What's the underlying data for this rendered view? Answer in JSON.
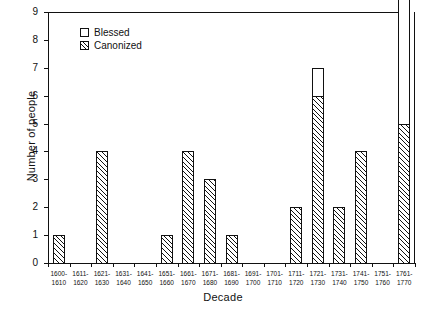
{
  "chart_data": {
    "type": "bar",
    "title": "",
    "xlabel": "Decade",
    "ylabel": "Number of people",
    "ylim": [
      0,
      9
    ],
    "yticks": [
      0,
      1,
      2,
      3,
      4,
      5,
      6,
      7,
      8,
      9
    ],
    "grid": false,
    "legend_position": "top-left",
    "stacked": true,
    "note": "Last bar (1761-1770) extends beyond the top of the axis (truncated at 9).",
    "categories": [
      "1600-\n1610",
      "1611-\n1620",
      "1621-\n1630",
      "1631-\n1640",
      "1641-\n1650",
      "1651-\n1660",
      "1661-\n1670",
      "1671-\n1680",
      "1681-\n1690",
      "1691-\n1700",
      "1701-\n1710",
      "1711-\n1720",
      "1721-\n1730",
      "1731-\n1740",
      "1741-\n1750",
      "1751-\n1760",
      "1761-\n1770"
    ],
    "category_lines": [
      [
        "1600-",
        "1610"
      ],
      [
        "1611-",
        "1620"
      ],
      [
        "1621-",
        "1630"
      ],
      [
        "1631-",
        "1640"
      ],
      [
        "1641-",
        "1650"
      ],
      [
        "1651-",
        "1660"
      ],
      [
        "1661-",
        "1670"
      ],
      [
        "1671-",
        "1680"
      ],
      [
        "1681-",
        "1690"
      ],
      [
        "1691-",
        "1700"
      ],
      [
        "1701-",
        "1710"
      ],
      [
        "1711-",
        "1720"
      ],
      [
        "1721-",
        "1730"
      ],
      [
        "1731-",
        "1740"
      ],
      [
        "1741-",
        "1750"
      ],
      [
        "1751-",
        "1760"
      ],
      [
        "1761-",
        "1770"
      ]
    ],
    "series": [
      {
        "name": "Canonized",
        "style": "hatched",
        "values": [
          1,
          0,
          4,
          0,
          0,
          1,
          4,
          3,
          1,
          0,
          0,
          2,
          6,
          2,
          4,
          0,
          5
        ]
      },
      {
        "name": "Blessed",
        "style": "open",
        "values": [
          0,
          0,
          0,
          0,
          0,
          0,
          0,
          0,
          0,
          0,
          0,
          0,
          1,
          0,
          0,
          0,
          4
        ]
      }
    ],
    "totals": [
      1,
      0,
      4,
      0,
      0,
      1,
      4,
      3,
      1,
      0,
      0,
      2,
      7,
      2,
      4,
      0,
      9
    ]
  },
  "legend": {
    "items": [
      {
        "label": "Blessed",
        "style": "open"
      },
      {
        "label": "Canonized",
        "style": "hatched"
      }
    ]
  },
  "axes": {
    "y_title": "Number of people",
    "x_title": "Decade"
  }
}
